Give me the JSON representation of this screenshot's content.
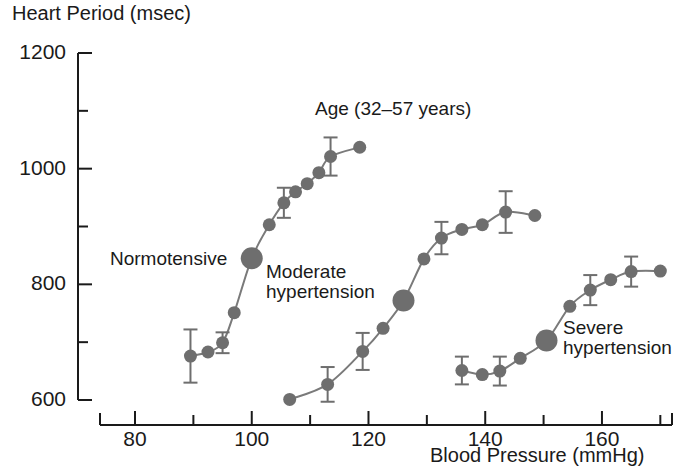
{
  "figure": {
    "title_annotation": "Age (32–57 years)",
    "y_axis_label": "Heart Period (msec)",
    "x_axis_label": "Blood Pressure (mmHg)",
    "marker_color": "#6e6e6e",
    "line_color": "#7a7a7a",
    "axis_color": "#1a1a1a"
  },
  "curve_labels": {
    "normotensive": "Normotensive",
    "moderate_line1": "Moderate",
    "moderate_line2": "hypertension",
    "severe_line1": "Severe",
    "severe_line2": "hypertension"
  },
  "chart_data": {
    "type": "line",
    "title": "Age (32–57 years)",
    "xlabel": "Blood Pressure (mmHg)",
    "ylabel": "Heart Period (msec)",
    "xlim": [
      74,
      172
    ],
    "ylim": [
      600,
      1200
    ],
    "grid": false,
    "legend": "inline annotations",
    "x_major_ticks": [
      80,
      100,
      120,
      140,
      160
    ],
    "x_minor_ticks": [
      90,
      110,
      130,
      150,
      170
    ],
    "x_tick_labels": [
      "80",
      "100",
      "120",
      "140",
      "160"
    ],
    "y_major_ticks": [
      600,
      800,
      1000,
      1200
    ],
    "y_minor_ticks": [
      700,
      900,
      1100
    ],
    "y_tick_labels": [
      "600",
      "800",
      "1000",
      "1200"
    ],
    "series": [
      {
        "name": "Normotensive",
        "set_point": {
          "x": 100,
          "y": 845
        },
        "points": [
          {
            "x": 89.5,
            "y": 676,
            "err": 46
          },
          {
            "x": 92.5,
            "y": 683,
            "err": 0
          },
          {
            "x": 95.0,
            "y": 699,
            "err": 18
          },
          {
            "x": 97.0,
            "y": 751,
            "err": 0
          },
          {
            "x": 100.0,
            "y": 845,
            "err": 0
          },
          {
            "x": 103.0,
            "y": 903,
            "err": 0
          },
          {
            "x": 105.5,
            "y": 941,
            "err": 26
          },
          {
            "x": 107.5,
            "y": 960,
            "err": 0
          },
          {
            "x": 109.5,
            "y": 974,
            "err": 0
          },
          {
            "x": 111.5,
            "y": 993,
            "err": 0
          },
          {
            "x": 113.5,
            "y": 1021,
            "err": 33
          },
          {
            "x": 118.5,
            "y": 1037,
            "err": 0
          }
        ]
      },
      {
        "name": "Moderate hypertension",
        "set_point": {
          "x": 126,
          "y": 772
        },
        "points": [
          {
            "x": 106.5,
            "y": 601,
            "err": 0
          },
          {
            "x": 113.0,
            "y": 627,
            "err": 30
          },
          {
            "x": 119.0,
            "y": 684,
            "err": 32
          },
          {
            "x": 122.5,
            "y": 724,
            "err": 0
          },
          {
            "x": 126.0,
            "y": 772,
            "err": 0
          },
          {
            "x": 129.5,
            "y": 844,
            "err": 0
          },
          {
            "x": 132.5,
            "y": 880,
            "err": 28
          },
          {
            "x": 136.0,
            "y": 895,
            "err": 0
          },
          {
            "x": 139.5,
            "y": 903,
            "err": 0
          },
          {
            "x": 143.5,
            "y": 925,
            "err": 36
          },
          {
            "x": 148.5,
            "y": 919,
            "err": 0
          }
        ]
      },
      {
        "name": "Severe hypertension",
        "set_point": {
          "x": 150.5,
          "y": 703
        },
        "points": [
          {
            "x": 136.0,
            "y": 651,
            "err": 24
          },
          {
            "x": 139.5,
            "y": 644,
            "err": 0
          },
          {
            "x": 142.5,
            "y": 650,
            "err": 25
          },
          {
            "x": 146.0,
            "y": 672,
            "err": 0
          },
          {
            "x": 150.5,
            "y": 703,
            "err": 0
          },
          {
            "x": 154.5,
            "y": 762,
            "err": 0
          },
          {
            "x": 158.0,
            "y": 790,
            "err": 26
          },
          {
            "x": 161.5,
            "y": 808,
            "err": 0
          },
          {
            "x": 165.0,
            "y": 822,
            "err": 26
          },
          {
            "x": 170.0,
            "y": 823,
            "err": 0
          }
        ]
      }
    ]
  }
}
